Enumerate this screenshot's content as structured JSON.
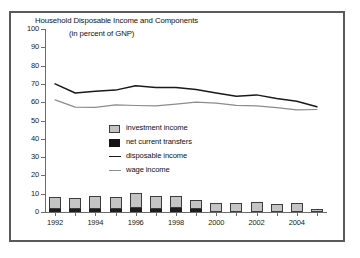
{
  "chart_data": {
    "type": "bar",
    "title": "Household Disposable Income and Components",
    "subtitle": "(in percent of GNP)",
    "xlabel": "",
    "ylabel": "",
    "ylim": [
      0,
      100
    ],
    "ytick_values": [
      0,
      10,
      20,
      30,
      40,
      50,
      60,
      70,
      80,
      90,
      100
    ],
    "ytick_labels": [
      "0",
      "10",
      "20",
      "30",
      "40",
      "50",
      "60",
      "70",
      "80",
      "90",
      "100"
    ],
    "grid": false,
    "legend_position": "center-left",
    "categories": [
      1992,
      1993,
      1994,
      1995,
      1996,
      1997,
      1998,
      1999,
      2000,
      2001,
      2002,
      2003,
      2004,
      2005
    ],
    "xtick_labels": [
      "1992",
      "1994",
      "1996",
      "1998",
      "2000",
      "2002",
      "2004"
    ],
    "xtick_years": [
      1992,
      1994,
      1996,
      1998,
      2000,
      2002,
      2004
    ],
    "series": [
      {
        "name": "net current transfers",
        "type": "bar-stacked",
        "color": "#1c1c1c",
        "values": [
          1.8,
          1.7,
          1.6,
          1.7,
          2.0,
          1.9,
          2.0,
          1.6,
          0.0,
          0.0,
          0.0,
          0.0,
          0.0,
          0.0
        ]
      },
      {
        "name": "investment income",
        "type": "bar-stacked",
        "color": "#c4c4c4",
        "values": [
          6.3,
          6.2,
          7.4,
          6.6,
          8.6,
          6.9,
          6.8,
          4.8,
          4.7,
          4.7,
          5.6,
          4.2,
          5.1,
          1.9
        ]
      },
      {
        "name": "disposable income",
        "type": "line",
        "color": "#1a1a1a",
        "values": [
          70.0,
          65.0,
          66.0,
          66.6,
          69.0,
          68.0,
          68.0,
          67.0,
          65.0,
          63.2,
          64.0,
          62.0,
          60.5,
          57.5
        ]
      },
      {
        "name": "wage income",
        "type": "line",
        "color": "#8c8c8c",
        "values": [
          61.3,
          57.3,
          57.2,
          58.5,
          58.2,
          58.0,
          59.0,
          60.0,
          59.5,
          58.3,
          58.0,
          57.0,
          55.8,
          56.0
        ]
      }
    ],
    "legend": [
      {
        "label": "investment income",
        "marker": "swatch-gray"
      },
      {
        "label": "net current transfers",
        "marker": "swatch-black"
      },
      {
        "label": "disposable income",
        "marker": "line-dark"
      },
      {
        "label": "wage income",
        "marker": "line-gray"
      }
    ]
  },
  "colors": {
    "frame_border": "#5a5a5a",
    "axis": "#6b6b6b",
    "background": "#ffffff",
    "investment_income": "#c4c4c4",
    "net_current_transfers": "#1c1c1c",
    "disposable_income": "#1a1a1a",
    "wage_income": "#8c8c8c"
  }
}
